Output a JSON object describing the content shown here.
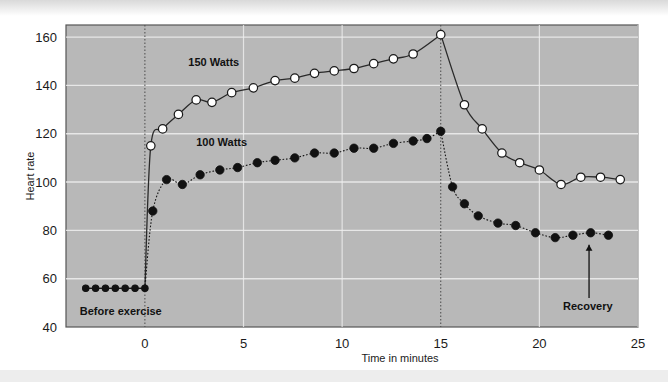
{
  "chart_data": {
    "type": "line",
    "title": "",
    "subtitle": "",
    "xlabel": "Time in minutes",
    "ylabel": "Heart rate",
    "xlim": [
      -4,
      25
    ],
    "ylim": [
      40,
      165
    ],
    "xticks": [
      0,
      5,
      10,
      15,
      20,
      25
    ],
    "xticklabels": [
      "0",
      "5",
      "10",
      "15",
      "20",
      "25"
    ],
    "yticks": [
      40,
      60,
      80,
      100,
      120,
      140,
      160
    ],
    "yticklabels": [
      "40",
      "60",
      "80",
      "100",
      "120",
      "140",
      "160"
    ],
    "grid": true,
    "grid_color": "#f0f0f0",
    "plot_bg": "#b8b8b8",
    "legend_position": "inline-annotation",
    "annotations": [
      {
        "name": "before-exercise",
        "text": "Before exercise",
        "x": -3.3,
        "y": 45
      },
      {
        "name": "recovery",
        "text": "Recovery",
        "x": 21.2,
        "y": 47,
        "arrow": true,
        "arrow_to_y": 74
      },
      {
        "name": "series-label-150w",
        "text": "150 Watts",
        "x": 2.2,
        "y": 148
      },
      {
        "name": "series-label-100w",
        "text": "100 Watts",
        "x": 2.6,
        "y": 115
      }
    ],
    "vertical_markers": [
      {
        "name": "exercise-start",
        "x": 0,
        "style": "dotted"
      },
      {
        "name": "exercise-end",
        "x": 15,
        "style": "dotted"
      }
    ],
    "series": [
      {
        "name": "150 Watts",
        "marker": "open-circle",
        "line": "solid",
        "color": "#2a2a2a",
        "points": [
          {
            "x": -3.0,
            "y": 56
          },
          {
            "x": -2.5,
            "y": 56
          },
          {
            "x": -2.0,
            "y": 56
          },
          {
            "x": -1.5,
            "y": 56
          },
          {
            "x": -1.0,
            "y": 56
          },
          {
            "x": -0.5,
            "y": 56
          },
          {
            "x": 0.0,
            "y": 56
          },
          {
            "x": 0.3,
            "y": 115
          },
          {
            "x": 0.9,
            "y": 122
          },
          {
            "x": 1.7,
            "y": 128
          },
          {
            "x": 2.6,
            "y": 134
          },
          {
            "x": 3.4,
            "y": 133
          },
          {
            "x": 4.4,
            "y": 137
          },
          {
            "x": 5.5,
            "y": 139
          },
          {
            "x": 6.6,
            "y": 142
          },
          {
            "x": 7.6,
            "y": 143
          },
          {
            "x": 8.6,
            "y": 145
          },
          {
            "x": 9.6,
            "y": 146
          },
          {
            "x": 10.6,
            "y": 147
          },
          {
            "x": 11.6,
            "y": 149
          },
          {
            "x": 12.6,
            "y": 151
          },
          {
            "x": 13.6,
            "y": 153
          },
          {
            "x": 15.0,
            "y": 161
          },
          {
            "x": 16.2,
            "y": 132
          },
          {
            "x": 17.1,
            "y": 122
          },
          {
            "x": 18.1,
            "y": 112
          },
          {
            "x": 19.0,
            "y": 108
          },
          {
            "x": 20.0,
            "y": 105
          },
          {
            "x": 21.1,
            "y": 99
          },
          {
            "x": 22.1,
            "y": 102
          },
          {
            "x": 23.1,
            "y": 102
          },
          {
            "x": 24.1,
            "y": 101
          }
        ]
      },
      {
        "name": "100 Watts",
        "marker": "filled-circle",
        "line": "dotted",
        "color": "#161616",
        "points": [
          {
            "x": -3.0,
            "y": 56
          },
          {
            "x": -2.5,
            "y": 56
          },
          {
            "x": -2.0,
            "y": 56
          },
          {
            "x": -1.5,
            "y": 56
          },
          {
            "x": -1.0,
            "y": 56
          },
          {
            "x": -0.5,
            "y": 56
          },
          {
            "x": 0.0,
            "y": 56
          },
          {
            "x": 0.4,
            "y": 88
          },
          {
            "x": 1.1,
            "y": 101
          },
          {
            "x": 1.9,
            "y": 99
          },
          {
            "x": 2.8,
            "y": 103
          },
          {
            "x": 3.8,
            "y": 105
          },
          {
            "x": 4.7,
            "y": 106
          },
          {
            "x": 5.7,
            "y": 108
          },
          {
            "x": 6.6,
            "y": 109
          },
          {
            "x": 7.6,
            "y": 110
          },
          {
            "x": 8.6,
            "y": 112
          },
          {
            "x": 9.6,
            "y": 112
          },
          {
            "x": 10.6,
            "y": 114
          },
          {
            "x": 11.6,
            "y": 114
          },
          {
            "x": 12.6,
            "y": 116
          },
          {
            "x": 13.6,
            "y": 117
          },
          {
            "x": 14.3,
            "y": 118
          },
          {
            "x": 15.0,
            "y": 121
          },
          {
            "x": 15.6,
            "y": 98
          },
          {
            "x": 16.2,
            "y": 91
          },
          {
            "x": 16.9,
            "y": 86
          },
          {
            "x": 17.9,
            "y": 83
          },
          {
            "x": 18.8,
            "y": 82
          },
          {
            "x": 19.8,
            "y": 79
          },
          {
            "x": 20.8,
            "y": 77
          },
          {
            "x": 21.7,
            "y": 78
          },
          {
            "x": 22.6,
            "y": 79
          },
          {
            "x": 23.5,
            "y": 78
          }
        ]
      }
    ]
  }
}
